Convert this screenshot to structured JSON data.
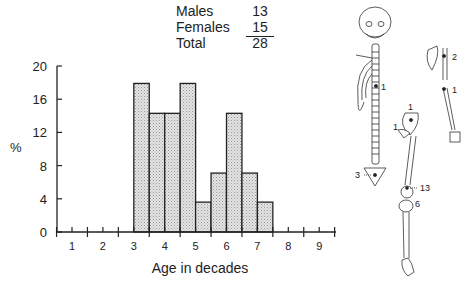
{
  "legend": {
    "rows": [
      {
        "label": "Males",
        "value": "13"
      },
      {
        "label": "Females",
        "value": "15"
      },
      {
        "label": "Total",
        "value": "28"
      }
    ]
  },
  "chart_data": {
    "type": "bar",
    "title": "",
    "xlabel": "Age in decades",
    "ylabel": "%",
    "ylim": [
      0,
      20
    ],
    "yticks": [
      0,
      4,
      8,
      12,
      16,
      20
    ],
    "xticks": [
      1,
      2,
      3,
      4,
      5,
      6,
      7,
      8,
      9
    ],
    "xlim": [
      0.5,
      9.5
    ],
    "bin_width": 0.5,
    "bins": [
      {
        "start": 3.0,
        "end": 3.5,
        "value": 17.9
      },
      {
        "start": 3.5,
        "end": 4.0,
        "value": 14.3
      },
      {
        "start": 4.0,
        "end": 4.5,
        "value": 14.3
      },
      {
        "start": 4.5,
        "end": 5.0,
        "value": 17.9
      },
      {
        "start": 5.0,
        "end": 5.5,
        "value": 3.6
      },
      {
        "start": 5.5,
        "end": 6.0,
        "value": 7.1
      },
      {
        "start": 6.0,
        "end": 6.5,
        "value": 14.3
      },
      {
        "start": 6.5,
        "end": 7.0,
        "value": 7.1
      },
      {
        "start": 7.0,
        "end": 7.5,
        "value": 3.6
      }
    ],
    "grid": false,
    "bar_fill": "#d9d9d9",
    "bar_edge": "#222222"
  },
  "skeleton": {
    "axial_labels": [
      {
        "label": "1"
      },
      {
        "label": "3"
      }
    ],
    "arm_labels": [
      {
        "label": "2"
      },
      {
        "label": "1"
      }
    ],
    "leg_labels": [
      {
        "label": "1"
      },
      {
        "label": "1"
      },
      {
        "label": "13"
      },
      {
        "label": "6"
      }
    ]
  }
}
